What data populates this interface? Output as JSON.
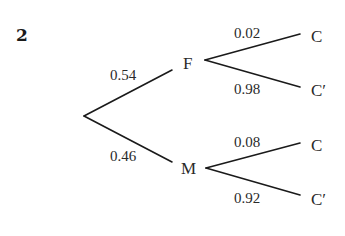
{
  "question_number": "2",
  "tree": {
    "root": {
      "branches": [
        {
          "label": "F",
          "probability": "0.54"
        },
        {
          "label": "M",
          "probability": "0.46"
        }
      ]
    },
    "level2": {
      "F": [
        {
          "label": "C",
          "probability": "0.02"
        },
        {
          "label": "C′",
          "probability": "0.98"
        }
      ],
      "M": [
        {
          "label": "C",
          "probability": "0.08"
        },
        {
          "label": "C′",
          "probability": "0.92"
        }
      ]
    }
  },
  "colors": {
    "line": "#1a1a1a",
    "text": "#2a2a2a",
    "background": "#ffffff"
  }
}
